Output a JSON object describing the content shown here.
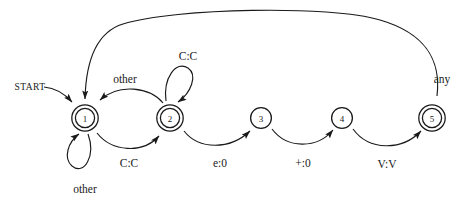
{
  "diagram": {
    "start_label": "START",
    "states": [
      {
        "id": "1",
        "label": "1",
        "cx": 85,
        "cy": 118,
        "accepting": true
      },
      {
        "id": "2",
        "label": "2",
        "cx": 170,
        "cy": 118,
        "accepting": true
      },
      {
        "id": "3",
        "label": "3",
        "cx": 261,
        "cy": 118,
        "accepting": false
      },
      {
        "id": "4",
        "label": "4",
        "cx": 342,
        "cy": 118,
        "accepting": false
      },
      {
        "id": "5",
        "label": "5",
        "cx": 432,
        "cy": 118,
        "accepting": true
      }
    ],
    "transitions": [
      {
        "id": "t-start",
        "from": "START",
        "to": "1",
        "label": ""
      },
      {
        "id": "t-1-self",
        "from": "1",
        "to": "1",
        "label": "other"
      },
      {
        "id": "t-2-1",
        "from": "2",
        "to": "1",
        "label": "other"
      },
      {
        "id": "t-1-2",
        "from": "1",
        "to": "2",
        "label": "C:C"
      },
      {
        "id": "t-2-self",
        "from": "2",
        "to": "2",
        "label": "C:C"
      },
      {
        "id": "t-2-3",
        "from": "2",
        "to": "3",
        "label": "e:0"
      },
      {
        "id": "t-3-4",
        "from": "3",
        "to": "4",
        "label": "+:0"
      },
      {
        "id": "t-4-5",
        "from": "4",
        "to": "5",
        "label": "V:V"
      },
      {
        "id": "t-5-1",
        "from": "5",
        "to": "1",
        "label": "any"
      }
    ],
    "colors": {
      "ink": "#1a1a1a",
      "paper": "#ffffff"
    }
  }
}
